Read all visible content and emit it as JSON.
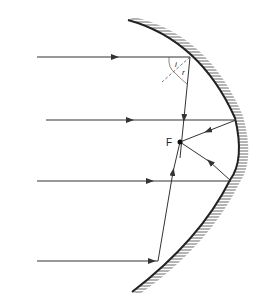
{
  "diagram": {
    "focus_label": "F",
    "angle_incidence_label": "i",
    "angle_reflection_label": "r",
    "colors": {
      "line": "#333333",
      "mirror": "#222222",
      "hatch": "#444444"
    }
  }
}
